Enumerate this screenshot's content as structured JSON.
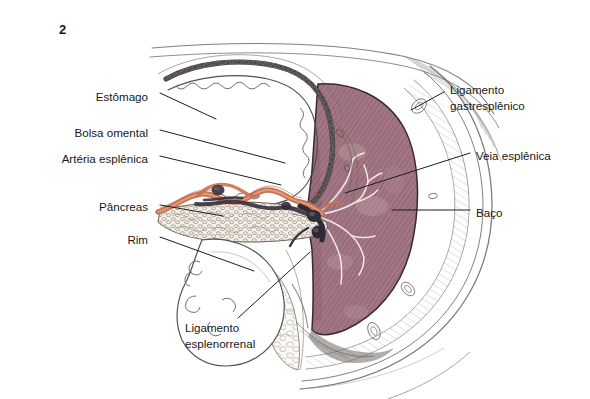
{
  "figure": {
    "number": "2",
    "background_color": "#ffffff",
    "ink_color": "#17171a"
  },
  "palette": {
    "spleen_fill": "#9f7480",
    "spleen_hatch": "#7d4f5d",
    "spleen_outline": "#3a2a2e",
    "artery_orange": "#c9724f",
    "vein_dark": "#3b3440",
    "pancreas_tan": "#b8a894",
    "peritoneum_grey": "#7a7570",
    "leader_line": "#1d1d20"
  },
  "labels": {
    "left": [
      {
        "id": "estomago",
        "text": "Estômago",
        "text_x": 148,
        "text_y": 97,
        "leader": [
          160,
          93,
          216,
          119
        ]
      },
      {
        "id": "bolsa-omental",
        "text": "Bolsa omental",
        "text_x": 148,
        "text_y": 133,
        "leader": [
          160,
          130,
          285,
          163
        ]
      },
      {
        "id": "arteria-esplenica",
        "text": "Artéria esplênica",
        "text_x": 148,
        "text_y": 159,
        "leader": [
          160,
          156,
          281,
          185
        ]
      },
      {
        "id": "pancreas",
        "text": "Pâncreas",
        "text_x": 148,
        "text_y": 207,
        "leader": [
          160,
          205,
          223,
          216
        ]
      },
      {
        "id": "rim",
        "text": "Rim",
        "text_x": 148,
        "text_y": 240,
        "leader": [
          160,
          237,
          254,
          271
        ]
      }
    ],
    "right": [
      {
        "id": "ligamento-gastresplenico",
        "lines": [
          "Ligamento",
          "gastresplênico"
        ],
        "text_x": 450,
        "text_y": 90,
        "leader": [
          444,
          92,
          411,
          110
        ]
      },
      {
        "id": "veia-esplenica",
        "lines": [
          "Veia esplênica"
        ],
        "text_x": 476,
        "text_y": 156,
        "leader": [
          470,
          153,
          345,
          193
        ]
      },
      {
        "id": "baco",
        "lines": [
          "Baço"
        ],
        "text_x": 476,
        "text_y": 213,
        "leader": [
          470,
          210,
          392,
          210
        ]
      }
    ],
    "bottom": [
      {
        "id": "ligamento-esplenorrenal",
        "lines": [
          "Ligamento",
          "esplenorrenal"
        ],
        "text_x": 185,
        "text_y": 328,
        "leader": [
          238,
          318,
          310,
          252
        ]
      }
    ]
  },
  "structures": [
    {
      "id": "stomach",
      "name": "Estômago"
    },
    {
      "id": "omental-bursa",
      "name": "Bolsa omental"
    },
    {
      "id": "splenic-artery",
      "name": "Artéria esplênica"
    },
    {
      "id": "pancreas",
      "name": "Pâncreas"
    },
    {
      "id": "kidney",
      "name": "Rim"
    },
    {
      "id": "spleen",
      "name": "Baço"
    },
    {
      "id": "splenic-vein",
      "name": "Veia esplênica"
    },
    {
      "id": "gastrosplenic-ligament",
      "name": "Ligamento gastresplênico"
    },
    {
      "id": "splenorenal-ligament",
      "name": "Ligamento esplenorrenal"
    }
  ]
}
